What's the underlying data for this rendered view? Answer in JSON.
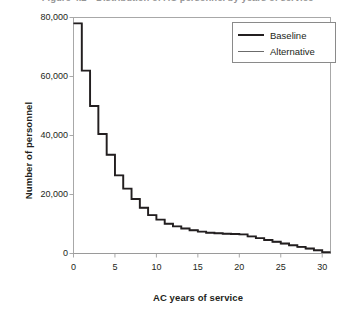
{
  "figure": {
    "title_clipped": "Figure 4.2—Distribution of AC personnel by years of service"
  },
  "chart_data": {
    "type": "line",
    "subtype": "step",
    "title": "Figure 4.2—Distribution of AC personnel by years of service",
    "xlabel": "AC years of service",
    "ylabel": "Number of personnel",
    "xlim": [
      0,
      31
    ],
    "ylim": [
      0,
      80000
    ],
    "xticks": [
      0,
      5,
      10,
      15,
      20,
      25,
      30
    ],
    "xtick_labels": [
      "0",
      "5",
      "10",
      "15",
      "20",
      "25",
      "30"
    ],
    "yticks": [
      0,
      20000,
      40000,
      60000,
      80000
    ],
    "ytick_labels": [
      "0",
      "20,000",
      "40,000",
      "60,000",
      "80,000"
    ],
    "grid": false,
    "legend_position": "top-right",
    "x": [
      0,
      1,
      2,
      3,
      4,
      5,
      6,
      7,
      8,
      9,
      10,
      11,
      12,
      13,
      14,
      15,
      16,
      17,
      18,
      19,
      20,
      21,
      22,
      23,
      24,
      25,
      26,
      27,
      28,
      29,
      30
    ],
    "series": [
      {
        "name": "Baseline",
        "color": "#231f20",
        "line_width": 1.9,
        "values": [
          78000,
          62000,
          50000,
          40500,
          33500,
          26500,
          22000,
          18500,
          15500,
          13000,
          11500,
          10100,
          9200,
          8500,
          7900,
          7400,
          7050,
          6850,
          6700,
          6600,
          6500,
          5800,
          5200,
          4600,
          4000,
          3400,
          2800,
          2250,
          1700,
          1100,
          400
        ]
      },
      {
        "name": "Alternative",
        "color": "#6b6b6b",
        "line_width": 1.0,
        "values": [
          78000,
          62000,
          50000,
          40500,
          33500,
          26500,
          22000,
          18500,
          15500,
          13000,
          11500,
          10100,
          9200,
          8500,
          7900,
          7400,
          7050,
          6850,
          6700,
          6600,
          6400,
          5700,
          5100,
          4500,
          3900,
          3300,
          2700,
          2150,
          1600,
          1000,
          350
        ]
      }
    ]
  },
  "legend": {
    "entries": [
      {
        "label": "Baseline"
      },
      {
        "label": "Alternative"
      }
    ]
  },
  "colors": {
    "baseline": "#231f20",
    "alternative": "#6b6b6b",
    "frame": "#a8a8a8",
    "text": "#231f20"
  }
}
